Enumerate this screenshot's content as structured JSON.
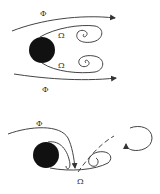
{
  "diagram": {
    "top": {
      "phi_top": "Φ",
      "omega_upper": "Ω",
      "omega_lower": "Ω",
      "phi_bottom": "Φ"
    },
    "bottom": {
      "phi": "Φ",
      "omega": "Ω"
    },
    "colors": {
      "body": "#111111",
      "stroke": "#444444"
    }
  }
}
